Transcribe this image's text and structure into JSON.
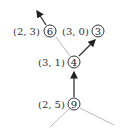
{
  "diagram": {
    "nodes": [
      {
        "id": "6",
        "label": "6",
        "annotation": "(2, 3)"
      },
      {
        "id": "3",
        "label": "3",
        "annotation": "(3, 0)"
      },
      {
        "id": "4",
        "label": "4",
        "annotation": "(3, 1)"
      },
      {
        "id": "9",
        "label": "9",
        "annotation": "(2, 5)"
      }
    ],
    "edges": [
      {
        "from": "9",
        "to": "4",
        "directed": true
      },
      {
        "from": "4",
        "to": "3",
        "directed": true
      },
      {
        "from": "6",
        "to": "up",
        "directed": true
      },
      {
        "from": "4",
        "to": "6",
        "directed": false
      },
      {
        "from": "9",
        "to": "lower-left",
        "directed": false
      },
      {
        "from": "9",
        "to": "lower-right",
        "directed": false
      }
    ]
  }
}
